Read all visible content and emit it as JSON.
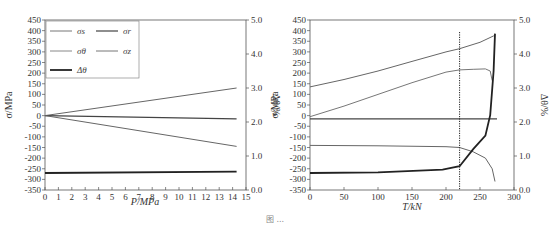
{
  "chart_data": [
    {
      "type": "line",
      "panel": "left",
      "xlabel": "P/MPa",
      "ylabel": "σ/MPa",
      "y2label": "Δθ/%",
      "xlim": [
        0,
        15
      ],
      "ylim": [
        -350,
        450
      ],
      "y2lim": [
        0.0,
        5.0
      ],
      "xticks": [
        "0",
        "1",
        "2",
        "3",
        "4",
        "5",
        "6",
        "7",
        "8",
        "9",
        "10",
        "11",
        "12",
        "13",
        "14",
        "15"
      ],
      "yticks": [
        "450",
        "400",
        "350",
        "300",
        "250",
        "200",
        "150",
        "100",
        "50",
        "0",
        "-50",
        "-100",
        "-150",
        "-200",
        "-250",
        "-300",
        "-350"
      ],
      "y2ticks": [
        "5.0",
        "4.0",
        "3.0",
        "2.0",
        "1.0",
        "0.0"
      ],
      "legend": {
        "position": "upper left",
        "entries": [
          "σs",
          "σr",
          "σθ",
          "σz",
          "Δθ"
        ]
      },
      "series": [
        {
          "name": "σs",
          "axis": "left",
          "x": [
            0,
            14.3
          ],
          "y": [
            0,
            130
          ]
        },
        {
          "name": "σr",
          "axis": "left",
          "x": [
            0,
            14.3
          ],
          "y": [
            0,
            -15
          ]
        },
        {
          "name": "σz",
          "axis": "left",
          "x": [
            0,
            14.3
          ],
          "y": [
            0,
            -145
          ]
        },
        {
          "name": "Δθ",
          "axis": "right",
          "x": [
            0,
            14.3
          ],
          "y": [
            0.5,
            0.54
          ]
        }
      ]
    },
    {
      "type": "line",
      "panel": "right",
      "xlabel": "T/kN",
      "ylabel": "σ/MPa",
      "y2label": "Δθ/%",
      "xlim": [
        0,
        300
      ],
      "ylim": [
        -350,
        450
      ],
      "y2lim": [
        0.0,
        5.0
      ],
      "xticks": [
        "0",
        "50",
        "100",
        "150",
        "200",
        "250",
        "300"
      ],
      "yticks": [
        "450",
        "400",
        "350",
        "300",
        "250",
        "200",
        "150",
        "100",
        "50",
        "0",
        "-50",
        "-100",
        "-150",
        "-200",
        "-250",
        "-300",
        "-350"
      ],
      "y2ticks": [
        "5.0",
        "4.0",
        "3.0",
        "2.0",
        "1.0",
        "0.0"
      ],
      "annotations": [
        {
          "type": "vertical-dotted-line",
          "x": 220
        }
      ],
      "series": [
        {
          "name": "σs",
          "axis": "left",
          "x": [
            0,
            50,
            100,
            150,
            200,
            220,
            250,
            270,
            272
          ],
          "y": [
            135,
            170,
            210,
            255,
            300,
            315,
            345,
            375,
            380
          ]
        },
        {
          "name": "σθ",
          "axis": "left",
          "x": [
            0,
            50,
            100,
            150,
            200,
            220,
            240,
            258,
            265,
            268
          ],
          "y": [
            -5,
            45,
            100,
            155,
            205,
            215,
            218,
            220,
            210,
            165
          ]
        },
        {
          "name": "σr",
          "axis": "left",
          "x": [
            0,
            100,
            200,
            275
          ],
          "y": [
            -15,
            -15,
            -15,
            -15
          ]
        },
        {
          "name": "σz",
          "axis": "left",
          "x": [
            0,
            100,
            200,
            220,
            240,
            258,
            268,
            272
          ],
          "y": [
            -140,
            -142,
            -146,
            -150,
            -170,
            -200,
            -250,
            -310
          ]
        },
        {
          "name": "Δθ",
          "axis": "right",
          "x": [
            0,
            100,
            195,
            220,
            240,
            258,
            265,
            270,
            272
          ],
          "y": [
            0.5,
            0.52,
            0.6,
            0.7,
            1.2,
            1.6,
            2.2,
            3.5,
            4.6
          ]
        }
      ]
    }
  ],
  "caption": {
    "text": "图 ..."
  }
}
